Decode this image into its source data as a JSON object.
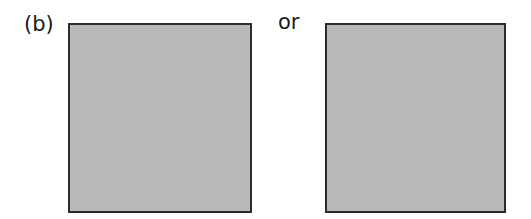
{
  "figure": {
    "panel_label": "(b)",
    "connector_text": "or",
    "boxes": [
      {
        "id": "left",
        "fill": "#b9b9b9",
        "border": "#2b2b2b"
      },
      {
        "id": "right",
        "fill": "#b9b9b9",
        "border": "#2b2b2b"
      }
    ]
  }
}
